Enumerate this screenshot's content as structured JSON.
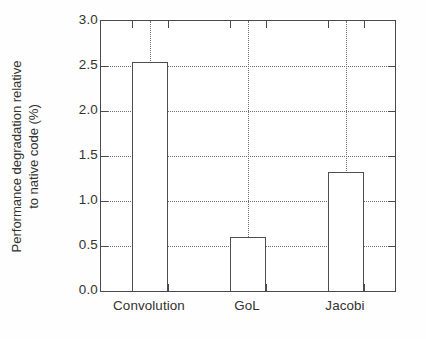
{
  "chart_data": {
    "type": "bar",
    "title": "",
    "subtitle": "",
    "xlabel": "",
    "ylabel": "Performance degradation relative to native code (%)",
    "ylabel_line1": "Performance degradation relative",
    "ylabel_line2": "to native code (%)",
    "categories": [
      "Convolution",
      "GoL",
      "Jacobi"
    ],
    "values": [
      2.55,
      0.6,
      1.32
    ],
    "ylim": [
      0.0,
      3.0
    ],
    "ytick_values": [
      0.0,
      0.5,
      1.0,
      1.5,
      2.0,
      2.5,
      3.0
    ],
    "ytick_labels": [
      "0.0",
      "0.5",
      "1.0",
      "1.5",
      "2.0",
      "2.5",
      "3.0"
    ],
    "grid": "dotted-both-axes",
    "legend": "none",
    "bar_fill": "#ffffff",
    "bar_edge": "#4e4e4e",
    "axis_color": "#4a4a4a",
    "grid_color": "#6e6e6e",
    "text_color": "#33322f",
    "background": "#fefefe",
    "annotations": []
  }
}
